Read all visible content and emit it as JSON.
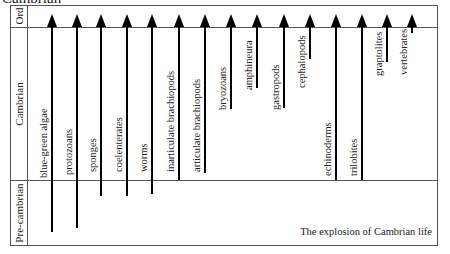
{
  "title": "Cambrian",
  "eras": [
    {
      "label": "Ord",
      "top": 5,
      "height": 22
    },
    {
      "label": "Cambrian",
      "top": 27,
      "height": 153
    },
    {
      "label": "Pre-cambrian",
      "top": 180,
      "height": 66
    }
  ],
  "taxa": [
    {
      "label": "blue-green algae",
      "x": 52,
      "bottom": 232,
      "label_bottom": 178
    },
    {
      "label": "protozoans",
      "x": 77,
      "bottom": 228,
      "label_bottom": 175
    },
    {
      "label": "sponges",
      "x": 101,
      "bottom": 196,
      "label_bottom": 172
    },
    {
      "label": "coelenterates",
      "x": 127,
      "bottom": 196,
      "label_bottom": 172
    },
    {
      "label": "worms",
      "x": 152,
      "bottom": 194,
      "label_bottom": 172
    },
    {
      "label": "inarticulate brachiopods",
      "x": 179,
      "bottom": 180,
      "label_bottom": 172
    },
    {
      "label": "articulate brachiopods",
      "x": 205,
      "bottom": 173,
      "label_bottom": 172
    },
    {
      "label": "bryozoans",
      "x": 231,
      "bottom": 109,
      "label_bottom": 110
    },
    {
      "label": "amphineura",
      "x": 257,
      "bottom": 88,
      "label_bottom": 90
    },
    {
      "label": "gastropods",
      "x": 284,
      "bottom": 108,
      "label_bottom": 110
    },
    {
      "label": "cephalopods",
      "x": 310,
      "bottom": 59,
      "label_bottom": 88
    },
    {
      "label": "echinoderms",
      "x": 336,
      "bottom": 180,
      "label_bottom": 176
    },
    {
      "label": "trilobites",
      "x": 362,
      "bottom": 180,
      "label_bottom": 176
    },
    {
      "label": "graptolites",
      "x": 387,
      "bottom": 62,
      "label_bottom": 76
    },
    {
      "label": "vertebrates",
      "x": 412,
      "bottom": 33,
      "label_bottom": 75
    }
  ],
  "caption": "The explosion of Cambrian life"
}
